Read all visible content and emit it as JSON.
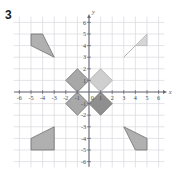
{
  "problem": {
    "number": "3"
  },
  "chart_data": {
    "type": "scatter",
    "title": "",
    "xlabel": "x",
    "ylabel": "y",
    "xlim": [
      -6.6,
      6.6
    ],
    "ylim": [
      -6.6,
      6.6
    ],
    "grid": true,
    "legend": "none",
    "x_ticks": [
      -6,
      -5,
      -4,
      -3,
      -2,
      -1,
      1,
      2,
      3,
      4,
      5,
      6
    ],
    "y_ticks": [
      6,
      5,
      4,
      3,
      2,
      1,
      -1,
      -2,
      -3,
      -4,
      -5,
      -6
    ],
    "origin_label": "0",
    "x_tick_labels": [
      "-6",
      "-5",
      "-4",
      "-3",
      "-2",
      "-1",
      "1",
      "2",
      "3",
      "4",
      "5",
      "6"
    ],
    "y_tick_labels": [
      "6",
      "5",
      "4",
      "3",
      "2",
      "1",
      "-1",
      "-2",
      "-3",
      "-4",
      "-5",
      "-6"
    ],
    "shapes": [
      {
        "name": "quadrilateral-top-left",
        "quadrant": "II",
        "fill": "#b0b0b0",
        "stroke": "#6e6e6e",
        "points": [
          [
            -5,
            5
          ],
          [
            -4,
            5
          ],
          [
            -3,
            3
          ],
          [
            -5,
            4
          ]
        ]
      },
      {
        "name": "quadrilateral-top-right",
        "quadrant": "I",
        "fill": "#d6d6d6",
        "stroke": "#b5b5b5",
        "points": [
          [
            3,
            3
          ],
          [
            5,
            5
          ],
          [
            5,
            4
          ],
          [
            4,
            4
          ]
        ]
      },
      {
        "name": "quadrilateral-bottom-left",
        "quadrant": "III",
        "fill": "#b0b0b0",
        "stroke": "#6e6e6e",
        "points": [
          [
            -5,
            -4
          ],
          [
            -3,
            -3
          ],
          [
            -3,
            -5
          ],
          [
            -5,
            -5
          ]
        ]
      },
      {
        "name": "quadrilateral-bottom-right",
        "quadrant": "IV",
        "fill": "#b0b0b0",
        "stroke": "#6e6e6e",
        "points": [
          [
            3,
            -3
          ],
          [
            5,
            -4
          ],
          [
            5,
            -5
          ],
          [
            4,
            -5
          ]
        ]
      },
      {
        "name": "diamond-upper-left",
        "fill": "#a8a8a8",
        "stroke": "#6e6e6e",
        "points": [
          [
            -1,
            2
          ],
          [
            0,
            1
          ],
          [
            -1,
            0
          ],
          [
            -2,
            1
          ]
        ]
      },
      {
        "name": "diamond-upper-right",
        "fill": "#cfcfcf",
        "stroke": "#a8a8a8",
        "points": [
          [
            1,
            2
          ],
          [
            2,
            1
          ],
          [
            1,
            0
          ],
          [
            0,
            1
          ]
        ]
      },
      {
        "name": "diamond-lower-left",
        "fill": "#a8a8a8",
        "stroke": "#6e6e6e",
        "points": [
          [
            -1,
            0
          ],
          [
            0,
            -1
          ],
          [
            -1,
            -2
          ],
          [
            -2,
            -1
          ]
        ]
      },
      {
        "name": "diamond-lower-right",
        "fill": "#8f8f8f",
        "stroke": "#6e6e6e",
        "points": [
          [
            1,
            0
          ],
          [
            2,
            -1
          ],
          [
            1,
            -2
          ],
          [
            0,
            -1
          ]
        ]
      }
    ],
    "colors": {
      "grid": "#d8d8e0",
      "axis": "#6b6b78",
      "background": "#ffffff",
      "label": "#4a4a4a"
    }
  }
}
